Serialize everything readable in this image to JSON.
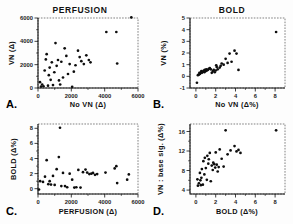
{
  "figure": {
    "name": "four-panel-scatter-figure",
    "panels": [
      "A.",
      "B.",
      "C.",
      "D."
    ]
  },
  "chart_data": [
    {
      "type": "scatter",
      "panel": "A.",
      "title": "PERFUSION",
      "xlabel": "No VN (Δ)",
      "ylabel": "VN (Δ)",
      "xlim": [
        0,
        6000
      ],
      "ylim": [
        0,
        6000
      ],
      "xticks": [
        0,
        2000,
        4000,
        6000
      ],
      "yticks": [
        0,
        2000,
        4000,
        6000
      ],
      "xticklabels": [
        "0",
        "2000",
        "4000",
        "6000"
      ],
      "yticklabels": [
        "0",
        "2000",
        "4000",
        "6000"
      ],
      "grid": false,
      "legend": "none",
      "x": [
        120,
        180,
        250,
        330,
        400,
        470,
        520,
        600,
        650,
        700,
        760,
        830,
        900,
        980,
        1050,
        1120,
        1200,
        1260,
        1330,
        1400,
        1500,
        1600,
        1700,
        1800,
        1900,
        2050,
        2150,
        2250,
        2400,
        2500,
        2600,
        2750,
        2900,
        3050,
        3150,
        4100,
        4700,
        4750,
        5600
      ],
      "y": [
        500,
        120,
        300,
        150,
        1500,
        2450,
        2900,
        200,
        1100,
        1750,
        700,
        2200,
        250,
        1350,
        3850,
        1900,
        2400,
        650,
        300,
        2250,
        900,
        3400,
        2750,
        1200,
        2050,
        100,
        1400,
        1950,
        3200,
        2650,
        2300,
        2050,
        2800,
        2400,
        2200,
        4800,
        4800,
        2100,
        6050
      ]
    },
    {
      "type": "scatter",
      "panel": "B.",
      "title": "BOLD",
      "xlabel": "No VN (Δ%)",
      "ylabel": "VN (%)",
      "xlim": [
        -0.6,
        9
      ],
      "ylim": [
        -1,
        5
      ],
      "xticks": [
        0,
        2,
        4,
        6,
        8
      ],
      "yticks": [
        -1,
        0,
        1,
        2,
        3,
        4,
        5
      ],
      "xticklabels": [
        "0",
        "2",
        "4",
        "6",
        "8"
      ],
      "yticklabels": [
        "-1",
        "0",
        "1",
        "2",
        "3",
        "4",
        "5"
      ],
      "grid": false,
      "legend": "none",
      "x": [
        0.1,
        0.2,
        0.3,
        0.35,
        0.4,
        0.5,
        0.55,
        0.6,
        0.7,
        0.8,
        0.85,
        0.9,
        1.0,
        1.05,
        1.1,
        1.2,
        1.3,
        1.4,
        1.5,
        1.6,
        1.7,
        1.8,
        1.9,
        2.0,
        2.05,
        2.1,
        2.2,
        2.4,
        2.5,
        2.6,
        2.8,
        3.0,
        3.2,
        3.4,
        3.6,
        3.9,
        4.1,
        4.3,
        8.1
      ],
      "y": [
        -0.55,
        0.1,
        0.15,
        0.3,
        0.2,
        0.35,
        0.45,
        0.3,
        0.4,
        0.5,
        0.35,
        0.55,
        0.45,
        0.6,
        0.5,
        0.55,
        0.65,
        0.7,
        0.6,
        0.3,
        0.45,
        0.55,
        0.35,
        0.5,
        0.95,
        0.8,
        0.6,
        0.75,
        0.9,
        1.1,
        1.0,
        1.5,
        1.15,
        1.95,
        1.25,
        2.2,
        1.95,
        0.55,
        3.8
      ]
    },
    {
      "type": "scatter",
      "panel": "C.",
      "title": "",
      "xlabel": "PERFUSION    (Δ)",
      "ylabel": "BOLD (Δ%)",
      "xlim": [
        0,
        6000
      ],
      "ylim": [
        -0.7,
        8.6
      ],
      "xticks": [
        0,
        2000,
        4000,
        6000
      ],
      "yticks": [
        0,
        2,
        4,
        6,
        8
      ],
      "xticklabels": [
        "0",
        "2000",
        "4000",
        "6000"
      ],
      "yticklabels": [
        "0",
        "2",
        "4",
        "6",
        "8"
      ],
      "grid": false,
      "legend": "none",
      "x": [
        60,
        130,
        300,
        420,
        520,
        620,
        700,
        780,
        900,
        1000,
        1120,
        1250,
        1320,
        1400,
        1500,
        1620,
        1750,
        1900,
        2050,
        2180,
        2300,
        2420,
        2550,
        2700,
        2850,
        2950,
        3080,
        3200,
        3300,
        3420,
        3550,
        4050,
        4600,
        4700,
        4750,
        5350,
        5450
      ],
      "y": [
        -0.1,
        1.0,
        0.9,
        1.6,
        3.8,
        0.6,
        1.0,
        0.55,
        1.7,
        0.5,
        2.6,
        4.2,
        8.1,
        0.35,
        2.1,
        0.35,
        0.2,
        2.0,
        1.2,
        0.15,
        0.2,
        2.5,
        0.15,
        2.2,
        2.55,
        2.15,
        1.95,
        2.0,
        2.1,
        1.85,
        1.95,
        2.15,
        2.7,
        3.0,
        0.75,
        1.2,
        1.9
      ]
    },
    {
      "type": "scatter",
      "panel": "D.",
      "title": "",
      "xlabel": "BOLD   (Δ%)",
      "ylabel": "VN : base sig. (Δ%)",
      "xlim": [
        -0.6,
        9
      ],
      "ylim": [
        3.2,
        17.5
      ],
      "xticks": [
        0,
        2,
        4,
        6,
        8
      ],
      "yticks": [
        4,
        8,
        12,
        16
      ],
      "xticklabels": [
        "0",
        "2",
        "4",
        "6",
        "8"
      ],
      "yticklabels": [
        "4",
        "8",
        "12",
        "16"
      ],
      "grid": false,
      "legend": "none",
      "x": [
        0.15,
        0.2,
        0.3,
        0.4,
        0.45,
        0.5,
        0.55,
        0.6,
        0.7,
        0.75,
        0.85,
        0.9,
        1.0,
        1.1,
        1.15,
        1.25,
        1.3,
        1.4,
        1.5,
        1.6,
        1.7,
        1.75,
        1.85,
        1.95,
        2.0,
        2.1,
        2.2,
        2.3,
        2.4,
        2.6,
        2.8,
        3.0,
        3.2,
        3.5,
        3.9,
        4.1,
        4.3,
        4.5,
        8.1
      ],
      "y": [
        6.2,
        4.9,
        5.4,
        7.5,
        6.0,
        5.0,
        6.5,
        8.3,
        5.1,
        9.9,
        7.2,
        10.6,
        8.5,
        6.1,
        11.0,
        9.4,
        10.3,
        11.6,
        5.8,
        9.0,
        8.1,
        9.6,
        9.3,
        8.6,
        11.7,
        9.2,
        7.8,
        8.7,
        12.3,
        10.4,
        8.8,
        16.2,
        11.3,
        12.1,
        13.0,
        11.9,
        12.2,
        11.6,
        16.2
      ]
    }
  ]
}
